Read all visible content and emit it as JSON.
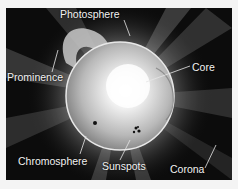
{
  "diagram": {
    "labels": {
      "photosphere": "Photosphere",
      "prominence": "Prominence",
      "core": "Core",
      "chromosphere": "Chromosphere",
      "sunspots": "Sunspots",
      "corona": "Corona"
    }
  }
}
